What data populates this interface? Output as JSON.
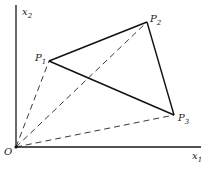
{
  "diagram": {
    "type": "vector-triangle",
    "colors": {
      "ink": "#111111",
      "background": "#ffffff"
    },
    "axes": {
      "x": {
        "label": "x",
        "subscript": "1"
      },
      "y": {
        "label": "x",
        "subscript": "2"
      }
    },
    "origin": {
      "label": "O"
    },
    "points": [
      {
        "id": "P1",
        "label": "P",
        "subscript": "1"
      },
      {
        "id": "P2",
        "label": "P",
        "subscript": "2"
      },
      {
        "id": "P3",
        "label": "P",
        "subscript": "3"
      }
    ],
    "edges_solid": [
      "P1-P2",
      "P2-P3",
      "P3-P1"
    ],
    "edges_dashed": [
      "O-P1",
      "O-P2",
      "O-P3"
    ]
  }
}
